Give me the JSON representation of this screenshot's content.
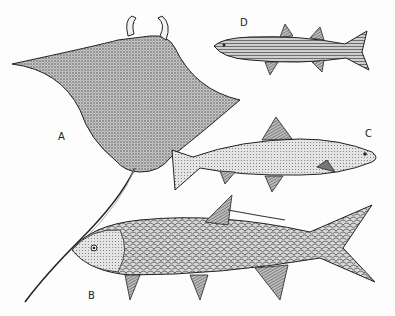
{
  "figure": {
    "labels": [
      {
        "id": "A",
        "text": "A",
        "subject": "ray (devil ray / eagle ray)",
        "x": 58,
        "y": 131
      },
      {
        "id": "B",
        "text": "B",
        "subject": "tarpon",
        "x": 88,
        "y": 290
      },
      {
        "id": "C",
        "text": "C",
        "subject": "trout / salmon",
        "x": 365,
        "y": 128
      },
      {
        "id": "D",
        "text": "D",
        "subject": "mullet",
        "x": 240,
        "y": 17
      }
    ],
    "colors": {
      "ink": "#1e1e1e",
      "paper": "#fdfdfd",
      "shade": "#9a9a9a"
    }
  }
}
